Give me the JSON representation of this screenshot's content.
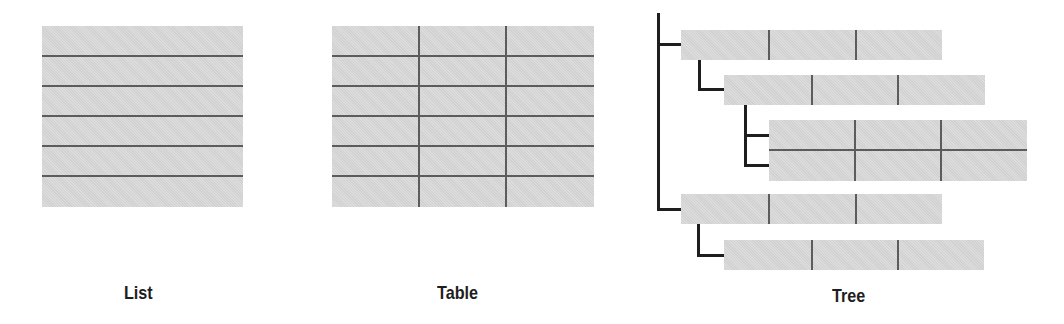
{
  "diagram": {
    "colors": {
      "fill": "#d8d8d8",
      "grid_line": "#5c5c5c",
      "connector": "#1e1e1e",
      "label": "#1e1e1e"
    },
    "views": [
      {
        "id": "list",
        "label": "List",
        "rows": 6,
        "columns": 1
      },
      {
        "id": "table",
        "label": "Table",
        "rows": 6,
        "columns": 3
      },
      {
        "id": "tree",
        "label": "Tree",
        "nodes": [
          {
            "level": 0,
            "rows": 1,
            "columns": 3
          },
          {
            "level": 1,
            "rows": 1,
            "columns": 3
          },
          {
            "level": 2,
            "rows": 2,
            "columns": 3
          },
          {
            "level": 0,
            "rows": 1,
            "columns": 3
          },
          {
            "level": 1,
            "rows": 1,
            "columns": 3
          }
        ]
      }
    ]
  }
}
